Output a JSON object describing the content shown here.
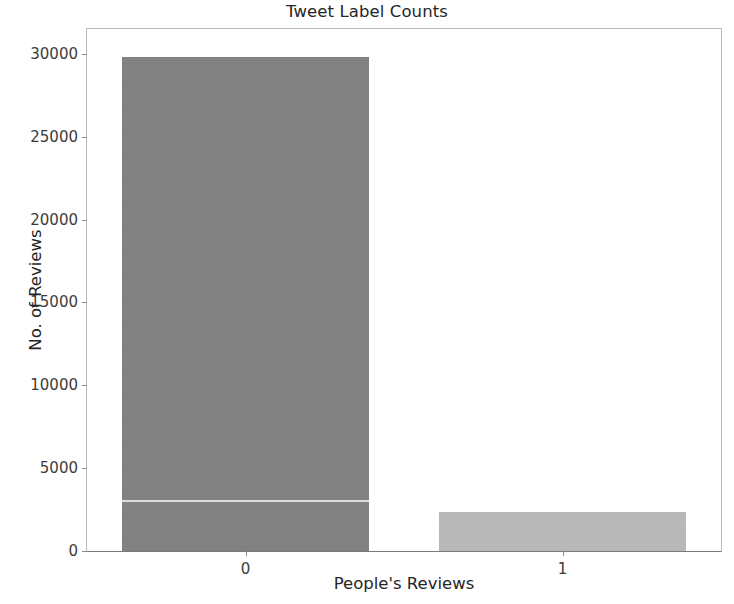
{
  "chart_data": {
    "type": "bar",
    "title": "Tweet Label Counts",
    "xlabel": "People's Reviews",
    "ylabel": "No. of Reviews",
    "categories": [
      "0",
      "1"
    ],
    "values": [
      29800,
      2350
    ],
    "series": [
      {
        "name": "No. of Reviews",
        "values": [
          29800,
          2350
        ]
      }
    ],
    "ylim": [
      0,
      31500
    ],
    "yticks": [
      0,
      5000,
      10000,
      15000,
      20000,
      25000,
      30000
    ],
    "ytick_labels": [
      "0",
      "5000",
      "10000",
      "15000",
      "20000",
      "25000",
      "30000"
    ],
    "xtick_labels": [
      "0",
      "1"
    ],
    "grid": false,
    "legend": null,
    "bar_colors": [
      "#828282",
      "#c0c0c0"
    ],
    "background_color": "#ffffff",
    "text_color": "#262626",
    "axis_color": "#8a8a8a"
  }
}
